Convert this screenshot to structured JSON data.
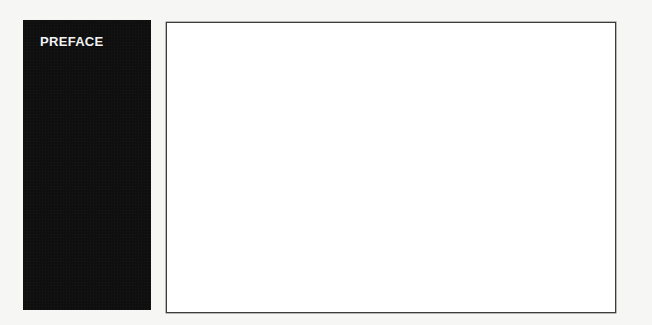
{
  "page": {
    "background_color": "#f6f6f4"
  },
  "sidebar": {
    "section_label": "PREFACE",
    "background_color": "#0f0f0f",
    "text_color": "#f2f2f2"
  },
  "content_frame": {
    "border_color": "#3c3c3c",
    "background_color": "#ffffff",
    "text": ""
  }
}
